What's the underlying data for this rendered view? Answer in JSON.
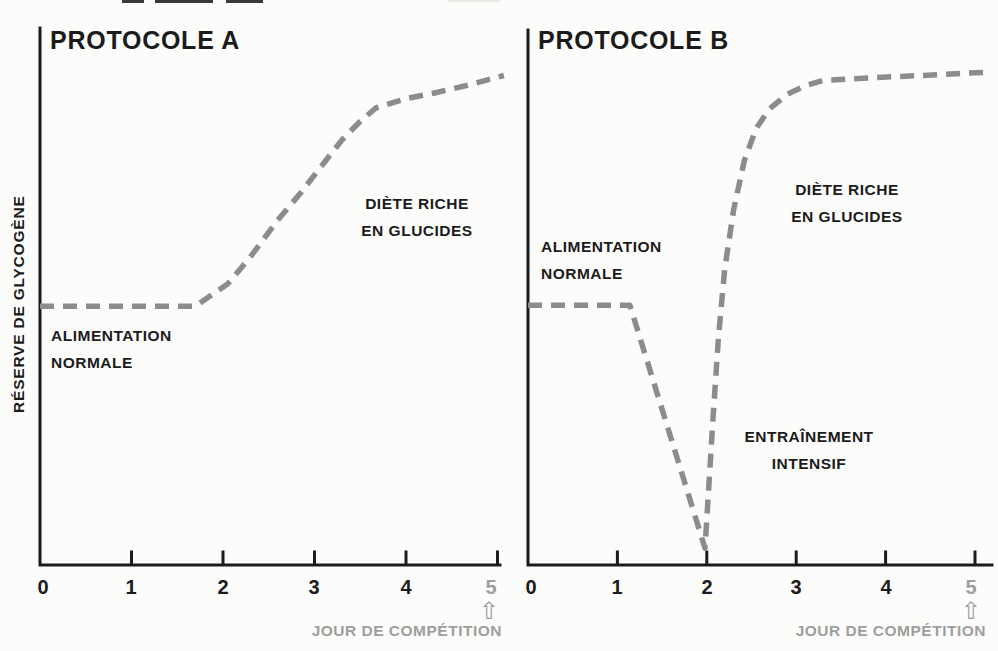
{
  "figure": {
    "background_color": "#fcfcfb",
    "dashed_line_color": "#8c8c8c",
    "axis_color": "#1b1b1b",
    "muted_text_color": "#9e9e9e",
    "y_axis_label": "RÉSERVE DE GLYCOGÈNE",
    "x_axis_label": "JOUR DE COMPÉTITION",
    "competition_arrow_icon": "⇧"
  },
  "protocole_a": {
    "title": "PROTOCOLE A",
    "ticks": [
      "0",
      "1",
      "2",
      "3",
      "4",
      "5"
    ],
    "annotations": {
      "baseline": [
        "ALIMENTATION",
        "NORMALE"
      ],
      "diet": [
        "DIÈTE RICHE",
        "EN GLUCIDES"
      ]
    }
  },
  "protocole_b": {
    "title": "PROTOCOLE B",
    "ticks": [
      "0",
      "1",
      "2",
      "3",
      "4",
      "5"
    ],
    "annotations": {
      "baseline": [
        "ALIMENTATION",
        "NORMALE"
      ],
      "diet": [
        "DIÈTE RICHE",
        "EN GLUCIDES"
      ],
      "training": [
        "ENTRAÎNEMENT",
        "INTENSIF"
      ]
    }
  },
  "chart_data": [
    {
      "type": "line",
      "title": "PROTOCOLE A",
      "xlabel": "JOUR DE COMPÉTITION",
      "ylabel": "RÉSERVE DE GLYCOGÈNE",
      "x_ticks": [
        0,
        1,
        2,
        3,
        4,
        5
      ],
      "x_range": [
        0,
        5
      ],
      "y_range_relative": [
        0,
        1
      ],
      "line_style": "dashed",
      "legend": "none",
      "grid": false,
      "annotations": [
        "ALIMENTATION NORMALE (flat baseline, days 0–1.7)",
        "DIÈTE RICHE EN GLUCIDES (rise, days 1.7–5)",
        "arrow at day 5 = JOUR DE COMPÉTITION"
      ],
      "series": [
        {
          "name": "Réserve de glycogène (relative)",
          "points": [
            [
              0,
              0.525
            ],
            [
              1.7,
              0.525
            ],
            [
              2.05,
              0.57
            ],
            [
              2.3,
              0.625
            ],
            [
              2.6,
              0.7
            ],
            [
              2.85,
              0.755
            ],
            [
              3.1,
              0.815
            ],
            [
              3.3,
              0.862
            ],
            [
              3.5,
              0.9
            ],
            [
              3.67,
              0.927
            ],
            [
              4.0,
              0.946
            ],
            [
              4.3,
              0.957
            ],
            [
              4.65,
              0.972
            ],
            [
              5.07,
              0.993
            ]
          ]
        }
      ]
    },
    {
      "type": "line",
      "title": "PROTOCOLE B",
      "xlabel": "JOUR DE COMPÉTITION",
      "ylabel": "RÉSERVE DE GLYCOGÈNE",
      "x_ticks": [
        0,
        1,
        2,
        3,
        4,
        5
      ],
      "x_range": [
        0,
        5
      ],
      "y_range_relative": [
        0,
        1
      ],
      "line_style": "dashed",
      "legend": "none",
      "grid": false,
      "annotations": [
        "ALIMENTATION NORMALE (flat baseline, days 0–1.15)",
        "ENTRAÎNEMENT INTENSIF (depletion dip to near zero at day 2)",
        "DIÈTE RICHE EN GLUCIDES (sharp supercompensation rise, days 2–3)",
        "arrow at day 5 = JOUR DE COMPÉTITION"
      ],
      "series": [
        {
          "name": "Réserve de glycogène (relative)",
          "points": [
            [
              0,
              0.527
            ],
            [
              1.14,
              0.527
            ],
            [
              1.98,
              0.034
            ],
            [
              2.07,
              0.3
            ],
            [
              2.13,
              0.46
            ],
            [
              2.2,
              0.6
            ],
            [
              2.3,
              0.72
            ],
            [
              2.42,
              0.82
            ],
            [
              2.55,
              0.885
            ],
            [
              2.7,
              0.925
            ],
            [
              2.9,
              0.955
            ],
            [
              3.1,
              0.972
            ],
            [
              3.3,
              0.983
            ],
            [
              3.8,
              0.988
            ],
            [
              4.4,
              0.993
            ],
            [
              5.18,
              1.0
            ]
          ]
        }
      ]
    }
  ]
}
